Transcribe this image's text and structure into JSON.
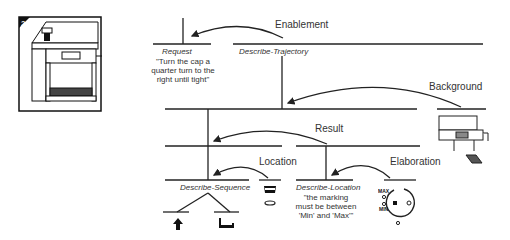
{
  "step_illustration": {
    "step_number": "2",
    "icon": "espresso-machine-illustration"
  },
  "relations": {
    "enablement": "Enablement",
    "background": "Background",
    "result": "Result",
    "location": "Location",
    "elaboration": "Elaboration"
  },
  "nodes": {
    "request": {
      "label": "Request",
      "quote": [
        "\"Turn the cap a",
        "quarter turn to the",
        "right until tight\""
      ]
    },
    "describe_trajectory": {
      "label": "Describe-Trajectory"
    },
    "describe_sequence": {
      "label": "Describe-Sequence"
    },
    "describe_location": {
      "label": "Describe-Location",
      "quote": [
        "\"the  marking",
        "must be between",
        "'Min' and 'Max'\""
      ]
    }
  },
  "icons": {
    "up_arrow": "up-arrow-icon",
    "cap": "cap-icon",
    "gauge": "min-max-gauge-icon",
    "gauge_max": "MAX",
    "gauge_min": "MIN"
  }
}
